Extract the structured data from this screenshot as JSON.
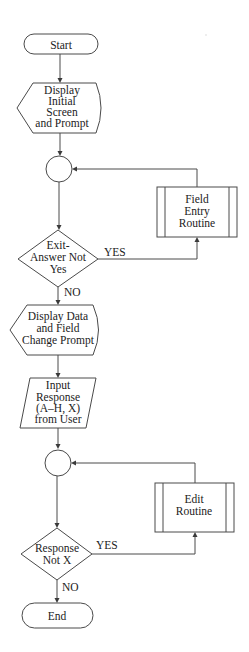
{
  "diagram": {
    "type": "flowchart",
    "nodes": {
      "start": {
        "shape": "terminal",
        "lines": [
          "Start"
        ]
      },
      "display_initial": {
        "shape": "display",
        "lines": [
          "Display",
          "Initial",
          "Screen",
          "and Prompt"
        ]
      },
      "connector_1": {
        "shape": "connector",
        "lines": []
      },
      "field_entry": {
        "shape": "predefined-process",
        "lines": [
          "Field",
          "Entry",
          "Routine"
        ]
      },
      "decision_exit": {
        "shape": "decision",
        "lines": [
          "Exit-",
          "Answer Not",
          "Yes"
        ]
      },
      "display_data": {
        "shape": "display",
        "lines": [
          "Display Data",
          "and Field",
          "Change Prompt"
        ]
      },
      "input_response": {
        "shape": "input-output",
        "lines": [
          "Input",
          "Response",
          "(A–H, X)",
          "from User"
        ]
      },
      "connector_2": {
        "shape": "connector",
        "lines": []
      },
      "edit_routine": {
        "shape": "predefined-process",
        "lines": [
          "Edit",
          "Routine"
        ]
      },
      "decision_response": {
        "shape": "decision",
        "lines": [
          "Response",
          "Not X"
        ]
      },
      "end": {
        "shape": "terminal",
        "lines": [
          "End"
        ]
      }
    },
    "edge_labels": {
      "exit_yes": "YES",
      "exit_no": "NO",
      "response_yes": "YES",
      "response_no": "NO"
    },
    "edges": [
      {
        "from": "start",
        "to": "display_initial"
      },
      {
        "from": "display_initial",
        "to": "connector_1"
      },
      {
        "from": "connector_1",
        "to": "decision_exit"
      },
      {
        "from": "decision_exit",
        "to": "field_entry",
        "label": "YES"
      },
      {
        "from": "field_entry",
        "to": "connector_1"
      },
      {
        "from": "decision_exit",
        "to": "display_data",
        "label": "NO"
      },
      {
        "from": "display_data",
        "to": "input_response"
      },
      {
        "from": "input_response",
        "to": "connector_2"
      },
      {
        "from": "connector_2",
        "to": "decision_response"
      },
      {
        "from": "decision_response",
        "to": "edit_routine",
        "label": "YES"
      },
      {
        "from": "edit_routine",
        "to": "connector_2"
      },
      {
        "from": "decision_response",
        "to": "end",
        "label": "NO"
      }
    ],
    "colors": {
      "stroke": "#4a4a4a",
      "text": "#222222",
      "background": "#ffffff"
    }
  }
}
